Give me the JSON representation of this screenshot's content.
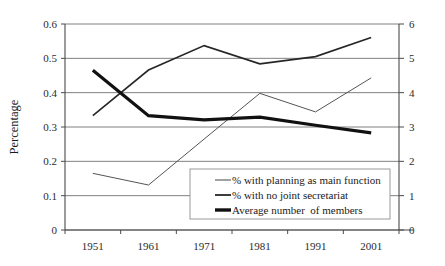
{
  "chart_data": {
    "type": "line",
    "title": "",
    "xlabel": "",
    "ylabel": "Percentage",
    "y2label": "",
    "categories": [
      "1951",
      "1961",
      "1971",
      "1981",
      "1991",
      "2001"
    ],
    "ylim": [
      0,
      0.6
    ],
    "y2lim": [
      0,
      6
    ],
    "yticks": [
      "0",
      "0.1",
      "0.2",
      "0.3",
      "0.4",
      "0.5",
      "0.6"
    ],
    "ytick_values": [
      0,
      0.1,
      0.2,
      0.3,
      0.4,
      0.5,
      0.6
    ],
    "y2ticks": [
      "0",
      "1",
      "2",
      "3",
      "4",
      "5",
      "6"
    ],
    "y2tick_values": [
      0,
      1,
      2,
      3,
      4,
      5,
      6
    ],
    "grid": true,
    "legend_position": "lower-center",
    "series": [
      {
        "name": "% with planning as main function",
        "axis": "left",
        "style": "thin",
        "values": [
          0.165,
          0.131,
          0.265,
          0.398,
          0.344,
          0.443
        ]
      },
      {
        "name": "% with no joint secretariat",
        "axis": "left",
        "style": "medium",
        "values": [
          0.333,
          0.466,
          0.537,
          0.484,
          0.505,
          0.561
        ]
      },
      {
        "name": "Average number  of members",
        "axis": "right",
        "style": "thick",
        "values": [
          4.65,
          3.33,
          3.21,
          3.29,
          3.05,
          2.83
        ]
      }
    ]
  },
  "axes": {
    "left_title": "Percentage",
    "left_ticks": [
      "0.6",
      "0.5",
      "0.4",
      "0.3",
      "0.2",
      "0.1",
      "0"
    ],
    "right_ticks": [
      "6",
      "5",
      "4",
      "3",
      "2",
      "1",
      "0"
    ],
    "x_ticks": [
      "1951",
      "1961",
      "1971",
      "1981",
      "1991",
      "2001"
    ]
  },
  "legend": {
    "items": [
      {
        "label": "% with planning as main function",
        "style": "thin"
      },
      {
        "label": "% with no joint secretariat",
        "style": "medium"
      },
      {
        "label": "Average number  of members",
        "style": "thick"
      }
    ]
  }
}
